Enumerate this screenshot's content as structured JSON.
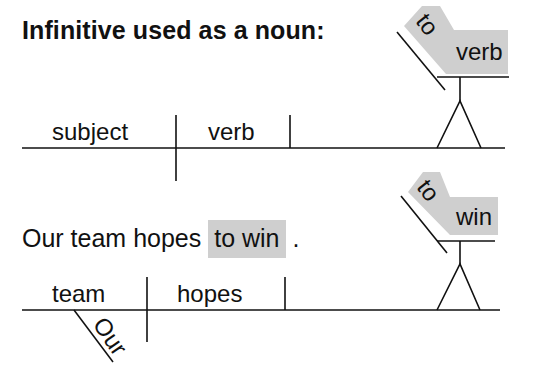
{
  "title": "Infinitive used as a noun:",
  "diagram_top": {
    "subject": "subject",
    "verb": "verb",
    "infinitive_marker": "to",
    "infinitive_verb": "verb"
  },
  "example": {
    "sentence_prefix": "Our team hopes",
    "highlighted_phrase": "to win",
    "sentence_suffix": ".",
    "subject": "team",
    "verb": "hopes",
    "modifier": "Our",
    "infinitive_marker": "to",
    "infinitive_verb": "win"
  },
  "colors": {
    "highlight": "#cfcfcf",
    "line": "#111111",
    "text": "#111111"
  }
}
